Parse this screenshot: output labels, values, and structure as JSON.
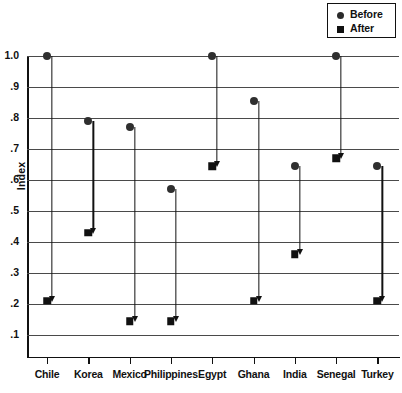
{
  "chart_data": {
    "type": "scatter",
    "title": "",
    "xlabel": "",
    "ylabel": "Index",
    "ylim": [
      0.1,
      1.0
    ],
    "yticks": [
      "1.0",
      ".9",
      ".8",
      ".7",
      ".6",
      ".5",
      ".4",
      ".3",
      ".2",
      ".1"
    ],
    "ytick_values": [
      1.0,
      0.9,
      0.8,
      0.7,
      0.6,
      0.5,
      0.4,
      0.3,
      0.2,
      0.1
    ],
    "grid": true,
    "legend_position": "top-right",
    "categories": [
      "Chile",
      "Korea",
      "Mexico",
      "Philippines",
      "Egypt",
      "Ghana",
      "India",
      "Senegal",
      "Turkey"
    ],
    "series": [
      {
        "name": "Before",
        "marker": "circle",
        "color": "#2f2f2f",
        "values": [
          1.0,
          0.79,
          0.77,
          0.57,
          1.0,
          0.855,
          0.645,
          1.0,
          0.645
        ]
      },
      {
        "name": "After",
        "marker": "square",
        "color": "#111111",
        "values": [
          0.21,
          0.43,
          0.145,
          0.145,
          0.645,
          0.21,
          0.36,
          0.67,
          0.21
        ]
      }
    ],
    "annotations": "Downward arrows connect each Before value to its After value."
  },
  "legend": {
    "items": [
      {
        "label": "Before",
        "marker": "circle"
      },
      {
        "label": "After",
        "marker": "square"
      }
    ]
  },
  "axes": {
    "y_title": "Index"
  }
}
